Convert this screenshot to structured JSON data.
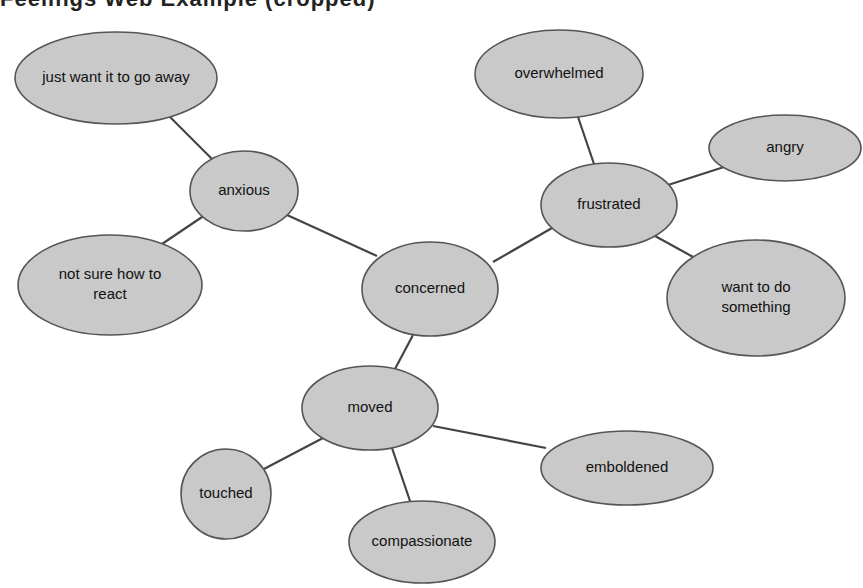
{
  "heading": {
    "text": "Feelings Web Example (cropped)",
    "visible": "partially cropped at top edge"
  },
  "diagram": {
    "type": "mind-map",
    "center": "concerned",
    "colors": {
      "node_fill": "#c9c9c9",
      "node_stroke": "#555555",
      "edge": "#444444",
      "text": "#111111",
      "background": "#ffffff"
    },
    "nodes": [
      {
        "id": "concerned",
        "label_lines": [
          "concerned"
        ],
        "cx": 430,
        "cy": 289,
        "rx": 68,
        "ry": 47
      },
      {
        "id": "anxious",
        "label_lines": [
          "anxious"
        ],
        "cx": 244,
        "cy": 191,
        "rx": 54,
        "ry": 40
      },
      {
        "id": "just-want-it-to-go-away",
        "label_lines": [
          "just want it to go away"
        ],
        "cx": 116,
        "cy": 78,
        "rx": 101,
        "ry": 46
      },
      {
        "id": "not-sure-how-to-react",
        "label_lines": [
          "not sure how to",
          "react"
        ],
        "cx": 110,
        "cy": 285,
        "rx": 92,
        "ry": 50
      },
      {
        "id": "frustrated",
        "label_lines": [
          "frustrated"
        ],
        "cx": 609,
        "cy": 205,
        "rx": 68,
        "ry": 42
      },
      {
        "id": "overwhelmed",
        "label_lines": [
          "overwhelmed"
        ],
        "cx": 559,
        "cy": 74,
        "rx": 84,
        "ry": 44
      },
      {
        "id": "angry",
        "label_lines": [
          "angry"
        ],
        "cx": 785,
        "cy": 148,
        "rx": 76,
        "ry": 33
      },
      {
        "id": "want-to-do-something",
        "label_lines": [
          "want to do",
          "something"
        ],
        "cx": 756,
        "cy": 298,
        "rx": 89,
        "ry": 58
      },
      {
        "id": "moved",
        "label_lines": [
          "moved"
        ],
        "cx": 370,
        "cy": 408,
        "rx": 68,
        "ry": 42
      },
      {
        "id": "touched",
        "label_lines": [
          "touched"
        ],
        "cx": 226,
        "cy": 494,
        "rx": 45,
        "ry": 45
      },
      {
        "id": "compassionate",
        "label_lines": [
          "compassionate"
        ],
        "cx": 422,
        "cy": 542,
        "rx": 73,
        "ry": 41
      },
      {
        "id": "emboldened",
        "label_lines": [
          "emboldened"
        ],
        "cx": 627,
        "cy": 468,
        "rx": 86,
        "ry": 37
      }
    ],
    "edges": [
      {
        "from": "concerned",
        "to": "anxious",
        "x1": 377,
        "y1": 256,
        "x2": 287,
        "y2": 215
      },
      {
        "from": "anxious",
        "to": "just-want-it-to-go-away",
        "x1": 212,
        "y1": 159,
        "x2": 170,
        "y2": 117
      },
      {
        "from": "anxious",
        "to": "not-sure-how-to-react",
        "x1": 205,
        "y1": 215,
        "x2": 162,
        "y2": 244
      },
      {
        "from": "concerned",
        "to": "frustrated",
        "x1": 493,
        "y1": 262,
        "x2": 552,
        "y2": 228
      },
      {
        "from": "frustrated",
        "to": "overwhelmed",
        "x1": 594,
        "y1": 164,
        "x2": 578,
        "y2": 117
      },
      {
        "from": "frustrated",
        "to": "angry",
        "x1": 668,
        "y1": 185,
        "x2": 724,
        "y2": 167
      },
      {
        "from": "frustrated",
        "to": "want-to-do-something",
        "x1": 655,
        "y1": 236,
        "x2": 695,
        "y2": 258
      },
      {
        "from": "concerned",
        "to": "moved",
        "x1": 413,
        "y1": 335,
        "x2": 395,
        "y2": 369
      },
      {
        "from": "moved",
        "to": "touched",
        "x1": 323,
        "y1": 438,
        "x2": 262,
        "y2": 470
      },
      {
        "from": "moved",
        "to": "compassionate",
        "x1": 392,
        "y1": 448,
        "x2": 410,
        "y2": 501
      },
      {
        "from": "moved",
        "to": "emboldened",
        "x1": 433,
        "y1": 426,
        "x2": 546,
        "y2": 448
      }
    ]
  }
}
